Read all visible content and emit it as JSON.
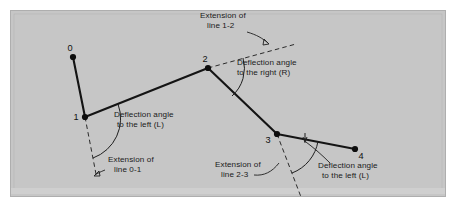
{
  "figure": {
    "name": "deflection-angle-traverse-diagram",
    "background_color": "#ffffff",
    "panel_color": "#c6c6c6",
    "panel_border_color": "#b0b0b0",
    "ink_color": "#141414"
  },
  "stations": [
    {
      "id": "0",
      "label": "0",
      "x": 73,
      "y": 57,
      "label_x": 70,
      "label_y": 51
    },
    {
      "id": "1",
      "label": "1",
      "x": 85,
      "y": 117,
      "label_x": 76,
      "label_y": 120
    },
    {
      "id": "2",
      "label": "2",
      "x": 208,
      "y": 68,
      "label_x": 205,
      "label_y": 62
    },
    {
      "id": "3",
      "label": "3",
      "x": 277,
      "y": 134,
      "label_x": 268,
      "label_y": 143
    },
    {
      "id": "4",
      "label": "4",
      "x": 355,
      "y": 149,
      "label_x": 359,
      "label_y": 159
    }
  ],
  "traverse_segments": [
    {
      "name": "segment-0-1",
      "from": "0",
      "to": "1"
    },
    {
      "name": "segment-1-2",
      "from": "1",
      "to": "2"
    },
    {
      "name": "segment-2-3",
      "from": "2",
      "to": "3"
    },
    {
      "name": "segment-3-4",
      "from": "3",
      "to": "4"
    }
  ],
  "extension_lines": [
    {
      "name": "extension-line-0-1",
      "of_line": "0-1",
      "x1": 85,
      "y1": 117,
      "x2": 96,
      "y2": 174
    },
    {
      "name": "extension-line-1-2",
      "of_line": "1-2",
      "x1": 208,
      "y1": 68,
      "x2": 296,
      "y2": 44
    },
    {
      "name": "extension-line-2-3",
      "of_line": "2-3",
      "x1": 277,
      "y1": 134,
      "x2": 301,
      "y2": 197
    }
  ],
  "annotations": [
    {
      "name": "annotation-extension-line-1-2",
      "line1": "Extension of",
      "line2": "line 1-2",
      "x": 200,
      "y": 18
    },
    {
      "name": "annotation-deflection-right",
      "line1": "Deflection angle",
      "line2": "to the right (R)",
      "x": 237,
      "y": 65
    },
    {
      "name": "annotation-deflection-left-at-1",
      "line1": "Deflection angle",
      "line2": "to the left (L)",
      "x": 114,
      "y": 117
    },
    {
      "name": "annotation-extension-line-0-1",
      "line1": "Extension of",
      "line2": "line 0-1",
      "x": 108,
      "y": 162
    },
    {
      "name": "annotation-extension-line-2-3",
      "line1": "Extension of",
      "line2": "line 2-3",
      "x": 215,
      "y": 167
    },
    {
      "name": "annotation-deflection-left-at-3",
      "line1": "Deflection angle",
      "line2": "to the left (L)",
      "x": 318,
      "y": 168
    }
  ],
  "angle_arcs": [
    {
      "name": "arc-deflection-left-at-1",
      "vertex": "1"
    },
    {
      "name": "arc-deflection-right-at-2",
      "vertex": "2"
    },
    {
      "name": "arc-deflection-left-at-3",
      "vertex": "3"
    }
  ]
}
